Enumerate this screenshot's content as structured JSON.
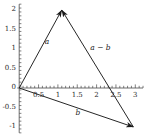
{
  "chart_data": {
    "type": "scatter",
    "title": "",
    "xlabel": "",
    "ylabel": "",
    "xlim": [
      -0.05,
      3.2
    ],
    "ylim": [
      -1.15,
      2.15
    ],
    "grid": false,
    "legend": "none",
    "x_ticks": [
      {
        "value": 0.5,
        "label": "0.5"
      },
      {
        "value": 1,
        "label": "1"
      },
      {
        "value": 1.5,
        "label": "1.5"
      },
      {
        "value": 2,
        "label": "2"
      },
      {
        "value": 2.5,
        "label": "2.5"
      },
      {
        "value": 3,
        "label": "3"
      }
    ],
    "y_ticks": [
      {
        "value": 2,
        "label": "2"
      },
      {
        "value": 1.5,
        "label": "1.5"
      },
      {
        "value": 1,
        "label": "1"
      },
      {
        "value": 0.5,
        "label": "0.5"
      },
      {
        "value": 0,
        "label": "0"
      },
      {
        "value": -0.5,
        "label": "-0.5"
      },
      {
        "value": -1,
        "label": "-1"
      }
    ],
    "x_minor_step": 0.1,
    "y_minor_step": 0.1,
    "axis_color": "#4a4a4a",
    "vector_color": "#1a1a1a",
    "vectors": [
      {
        "name": "a",
        "label": "a",
        "from": [
          0,
          0
        ],
        "to": [
          1.1,
          2.0
        ],
        "label_at": [
          0.72,
          1.17
        ]
      },
      {
        "name": "b",
        "label": "b",
        "from": [
          0,
          0
        ],
        "to": [
          2.95,
          -1.0
        ],
        "label_at": [
          1.52,
          -0.63
        ]
      },
      {
        "name": "a-b",
        "label": "a − b",
        "from": [
          2.95,
          -1.0
        ],
        "to": [
          1.1,
          2.0
        ],
        "label_at": [
          2.1,
          1.03
        ]
      }
    ]
  }
}
